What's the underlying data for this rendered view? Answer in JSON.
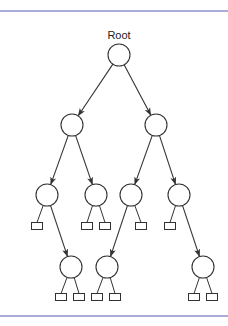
{
  "diagram": {
    "type": "binary-tree",
    "root_label": "Root",
    "colors": {
      "rule": "#a9acd9",
      "stroke": "#333333",
      "background": "#ffffff"
    },
    "rules": {
      "top_y": 11,
      "bottom_y": 316
    },
    "node_radius": 11,
    "leaf_size": {
      "w": 11,
      "h": 7
    },
    "nodes": [
      {
        "id": "root",
        "label": "Root",
        "x": 119,
        "y": 55
      },
      {
        "id": "A",
        "x": 72,
        "y": 125
      },
      {
        "id": "B",
        "x": 156,
        "y": 125
      },
      {
        "id": "C",
        "x": 47,
        "y": 195
      },
      {
        "id": "D",
        "x": 96,
        "y": 195
      },
      {
        "id": "E",
        "x": 131,
        "y": 195
      },
      {
        "id": "F",
        "x": 179,
        "y": 195
      },
      {
        "id": "G",
        "x": 71,
        "y": 267
      },
      {
        "id": "H",
        "x": 107,
        "y": 267
      },
      {
        "id": "I",
        "x": 203,
        "y": 267
      }
    ],
    "leaves": [
      {
        "id": "C-l",
        "parent": "C",
        "x": 37,
        "y": 226
      },
      {
        "id": "D-l",
        "parent": "D",
        "x": 87,
        "y": 226
      },
      {
        "id": "D-r",
        "parent": "D",
        "x": 105,
        "y": 226
      },
      {
        "id": "E-r",
        "parent": "E",
        "x": 141,
        "y": 226
      },
      {
        "id": "F-l",
        "parent": "F",
        "x": 170,
        "y": 226
      },
      {
        "id": "G-l",
        "parent": "G",
        "x": 61,
        "y": 297
      },
      {
        "id": "G-r",
        "parent": "G",
        "x": 79,
        "y": 297
      },
      {
        "id": "H-l",
        "parent": "H",
        "x": 97,
        "y": 297
      },
      {
        "id": "H-r",
        "parent": "H",
        "x": 115,
        "y": 297
      },
      {
        "id": "I-l",
        "parent": "I",
        "x": 194,
        "y": 297
      },
      {
        "id": "I-r",
        "parent": "I",
        "x": 212,
        "y": 297
      }
    ],
    "arrows": [
      {
        "from": "root",
        "to": "A"
      },
      {
        "from": "root",
        "to": "B"
      },
      {
        "from": "A",
        "to": "C"
      },
      {
        "from": "A",
        "to": "D"
      },
      {
        "from": "B",
        "to": "E"
      },
      {
        "from": "B",
        "to": "F"
      },
      {
        "from": "C",
        "to": "G"
      },
      {
        "from": "E",
        "to": "H"
      },
      {
        "from": "F",
        "to": "I"
      }
    ]
  }
}
